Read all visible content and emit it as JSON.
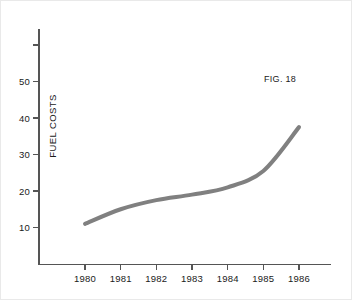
{
  "figure": {
    "caption": "FIG. 18",
    "background_color": "#ffffff",
    "border_color": "#e9e9e9",
    "curve_color": "#808080",
    "axis_color": "#555555",
    "text_color": "#1a1a1a"
  },
  "chart_data": {
    "type": "line",
    "title": "",
    "subtitle": "",
    "xlabel": "",
    "ylabel": "FUEL COSTS",
    "categories": [
      "1980",
      "1981",
      "1982",
      "1983",
      "1984",
      "1985",
      "1986"
    ],
    "x": [
      1980,
      1981,
      1982,
      1983,
      1984,
      1985,
      1986
    ],
    "values": [
      11,
      15,
      17.5,
      19,
      21,
      25.5,
      37.5
    ],
    "series": [
      {
        "name": "Fuel costs",
        "values": [
          11,
          15,
          17.5,
          19,
          21,
          25.5,
          37.5
        ],
        "color": "#808080"
      }
    ],
    "xlim": [
      1979.8,
      1986.2
    ],
    "ylim": [
      0,
      63.5
    ],
    "yticks": [
      10,
      20,
      30,
      40,
      50,
      60
    ],
    "ytick_labels": [
      "10",
      "20",
      "30",
      "40",
      "50",
      ""
    ],
    "xticks": [
      1980,
      1981,
      1982,
      1983,
      1984,
      1985,
      1986
    ],
    "xtick_labels": [
      "1980",
      "1981",
      "1982",
      "1983",
      "1984",
      "1985",
      "1986"
    ],
    "grid": false,
    "legend": false,
    "legend_position": "none",
    "annotations": [
      {
        "text": "FIG. 18",
        "x": 1985.2,
        "y": 51
      }
    ]
  },
  "axes": {
    "y_labels": [
      "50",
      "40",
      "30",
      "20",
      "10"
    ],
    "x_labels": [
      "1980",
      "1981",
      "1982",
      "1983",
      "1984",
      "1985",
      "1986"
    ],
    "y_axis_title": "FUEL COSTS"
  }
}
